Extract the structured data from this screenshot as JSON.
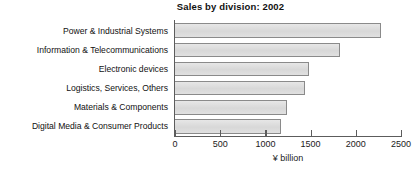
{
  "chart_data": {
    "type": "bar",
    "orientation": "horizontal",
    "title": "Sales by division: 2002",
    "xlabel": "¥ billion",
    "ylabel": "",
    "categories": [
      "Power & Industrial Systems",
      "Information & Telecommunications",
      "Electronic devices",
      "Logistics, Services, Others",
      "Materials & Components",
      "Digital Media & Consumer Products"
    ],
    "values": [
      2275,
      1830,
      1480,
      1435,
      1240,
      1170
    ],
    "xlim": [
      0,
      2500
    ],
    "xticks": [
      0,
      500,
      1000,
      1500,
      2000,
      2500
    ],
    "xtick_labels": [
      "0",
      "500",
      "1000",
      "1500",
      "2000",
      "2500"
    ],
    "grid": false,
    "legend": null,
    "bar_fill_color": "#dcdcdc",
    "bar_border_color": "#8a8a8a",
    "axis_color": "#5c5c5c",
    "background_color": "#ffffff"
  }
}
